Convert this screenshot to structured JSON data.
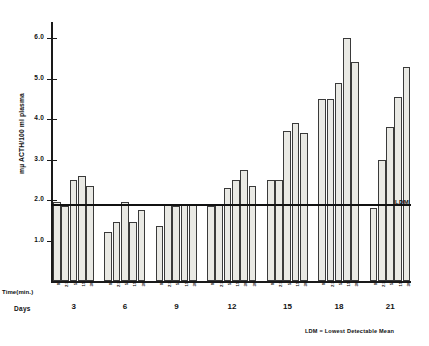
{
  "chart_data": {
    "type": "bar",
    "title": "",
    "xlabel": "Time(min.)",
    "ylabel": "mµ ACTH/100 ml plasma",
    "group_axis_label": "Days",
    "ylim": [
      0,
      6.4
    ],
    "yticks": [
      1.0,
      2.0,
      3.0,
      4.0,
      5.0,
      6.0
    ],
    "ytick_labels": [
      "1.0",
      "2.0",
      "3.0",
      "4.0",
      "5.0",
      "6.0"
    ],
    "grid": false,
    "legend": "none",
    "annotations": [
      {
        "name": "ldm-line",
        "label": "LDM",
        "value": 1.9,
        "orientation": "horizontal"
      }
    ],
    "footnote": "LDM = Lowest Detectable Mean",
    "group_categories": [
      "3",
      "6",
      "9",
      "12",
      "15",
      "18",
      "21"
    ],
    "time_points": [
      "0",
      "2.5",
      "5",
      "15",
      "30"
    ],
    "groups": [
      {
        "day": "3",
        "bars": [
          {
            "time": "0",
            "value": 1.95
          },
          {
            "time": "2.5",
            "value": 1.85
          },
          {
            "time": "5",
            "value": 2.5
          },
          {
            "time": "15",
            "value": 2.6
          },
          {
            "time": "30",
            "value": 2.35
          }
        ]
      },
      {
        "day": "6",
        "bars": [
          {
            "time": "0",
            "value": 1.2
          },
          {
            "time": "2.5",
            "value": 1.45
          },
          {
            "time": "5",
            "value": 1.95
          },
          {
            "time": "15",
            "value": 1.45
          },
          {
            "time": "30",
            "value": 1.75
          }
        ]
      },
      {
        "day": "9",
        "bars": [
          {
            "time": "0",
            "value": 1.35
          },
          {
            "time": "2.5",
            "value": 1.9
          },
          {
            "time": "5",
            "value": 1.85
          },
          {
            "time": "15",
            "value": 1.9
          },
          {
            "time": "30",
            "value": 1.9
          }
        ]
      },
      {
        "day": "12",
        "bars": [
          {
            "time": "0",
            "value": 1.85
          },
          {
            "time": "2.5",
            "value": 1.9
          },
          {
            "time": "5",
            "value": 2.3
          },
          {
            "time": "15",
            "value": 2.5
          },
          {
            "time": "30",
            "value": 2.75
          },
          {
            "time": "30b",
            "value": 2.35
          }
        ]
      },
      {
        "day": "15",
        "bars": [
          {
            "time": "0",
            "value": 2.5
          },
          {
            "time": "2.5",
            "value": 2.5
          },
          {
            "time": "5",
            "value": 3.7
          },
          {
            "time": "15",
            "value": 3.9
          },
          {
            "time": "30",
            "value": 3.65
          }
        ]
      },
      {
        "day": "18",
        "bars": [
          {
            "time": "0",
            "value": 4.5
          },
          {
            "time": "2.5",
            "value": 4.5
          },
          {
            "time": "5",
            "value": 4.9
          },
          {
            "time": "15",
            "value": 6.0
          },
          {
            "time": "30",
            "value": 5.4
          }
        ]
      },
      {
        "day": "21",
        "bars": [
          {
            "time": "0",
            "value": 1.8
          },
          {
            "time": "2.5",
            "value": 3.0
          },
          {
            "time": "5",
            "value": 3.8
          },
          {
            "time": "15",
            "value": 4.55
          },
          {
            "time": "30",
            "value": 5.3
          }
        ]
      }
    ]
  },
  "colors": {
    "bar_fill": "#e9e9e4",
    "bar_stroke": "#3a3a3a",
    "axis": "#1a1a1a",
    "text": "#111111",
    "background": "#ffffff"
  }
}
